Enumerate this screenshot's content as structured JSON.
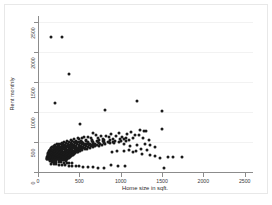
{
  "chart_data": {
    "type": "scatter",
    "title": "",
    "xlabel": "Home size in sqft.",
    "ylabel": "Rent monthly",
    "xlim": [
      0,
      2600
    ],
    "ylim": [
      0,
      2600
    ],
    "xticks": [
      0,
      500,
      1000,
      1500,
      2000,
      2500
    ],
    "yticks": [
      0,
      500,
      1000,
      1500,
      2000,
      2500
    ],
    "xticklabels": [
      "0",
      "500",
      "1000",
      "1500",
      "2000",
      "2500"
    ],
    "yticklabels": [
      "0",
      "500",
      "1000",
      "1500",
      "2000",
      "2500"
    ],
    "grid": "horizontal",
    "legend": "none",
    "marker": {
      "shape": "circle",
      "color": "#1a1a1a",
      "size": 3
    },
    "background_color": "#ffffff",
    "frame_color": "#e8e8e8",
    "axis_color": "#8c8c8c",
    "gridline_color": "#f2f2f2",
    "n_points": 330,
    "points": [
      [
        160,
        2250
      ],
      [
        290,
        2250
      ],
      [
        370,
        1640
      ],
      [
        205,
        1145
      ],
      [
        1200,
        1185
      ],
      [
        815,
        1040
      ],
      [
        1495,
        1010
      ],
      [
        505,
        805
      ],
      [
        1500,
        720
      ],
      [
        1230,
        700
      ],
      [
        1305,
        690
      ],
      [
        1285,
        680
      ],
      [
        1120,
        660
      ],
      [
        975,
        650
      ],
      [
        1080,
        640
      ],
      [
        660,
        645
      ],
      [
        700,
        620
      ],
      [
        885,
        635
      ],
      [
        1175,
        620
      ],
      [
        1225,
        615
      ],
      [
        760,
        600
      ],
      [
        820,
        600
      ],
      [
        945,
        595
      ],
      [
        1015,
        590
      ],
      [
        560,
        590
      ],
      [
        610,
        585
      ],
      [
        860,
        580
      ],
      [
        1060,
        575
      ],
      [
        1145,
        570
      ],
      [
        1265,
        565
      ],
      [
        480,
        575
      ],
      [
        530,
        565
      ],
      [
        640,
        560
      ],
      [
        720,
        560
      ],
      [
        790,
        555
      ],
      [
        905,
        550
      ],
      [
        995,
        550
      ],
      [
        1040,
        545
      ],
      [
        1100,
        540
      ],
      [
        1340,
        540
      ],
      [
        430,
        550
      ],
      [
        500,
        545
      ],
      [
        575,
        540
      ],
      [
        655,
        535
      ],
      [
        735,
        535
      ],
      [
        800,
        530
      ],
      [
        870,
        528
      ],
      [
        930,
        525
      ],
      [
        1000,
        520
      ],
      [
        1070,
        518
      ],
      [
        395,
        530
      ],
      [
        455,
        525
      ],
      [
        520,
        520
      ],
      [
        585,
        518
      ],
      [
        650,
        515
      ],
      [
        715,
        512
      ],
      [
        780,
        510
      ],
      [
        845,
        508
      ],
      [
        910,
        505
      ],
      [
        975,
        502
      ],
      [
        350,
        515
      ],
      [
        410,
        512
      ],
      [
        470,
        508
      ],
      [
        535,
        505
      ],
      [
        600,
        502
      ],
      [
        665,
        500
      ],
      [
        730,
        498
      ],
      [
        795,
        495
      ],
      [
        860,
        492
      ],
      [
        925,
        490
      ],
      [
        320,
        500
      ],
      [
        375,
        498
      ],
      [
        430,
        495
      ],
      [
        490,
        492
      ],
      [
        550,
        490
      ],
      [
        610,
        488
      ],
      [
        670,
        485
      ],
      [
        735,
        482
      ],
      [
        800,
        480
      ],
      [
        865,
        478
      ],
      [
        285,
        488
      ],
      [
        340,
        485
      ],
      [
        395,
        482
      ],
      [
        450,
        480
      ],
      [
        510,
        478
      ],
      [
        570,
        475
      ],
      [
        630,
        472
      ],
      [
        690,
        470
      ],
      [
        750,
        468
      ],
      [
        815,
        465
      ],
      [
        255,
        475
      ],
      [
        305,
        472
      ],
      [
        360,
        470
      ],
      [
        415,
        468
      ],
      [
        470,
        465
      ],
      [
        530,
        462
      ],
      [
        590,
        460
      ],
      [
        650,
        458
      ],
      [
        710,
        455
      ],
      [
        770,
        452
      ],
      [
        230,
        462
      ],
      [
        280,
        460
      ],
      [
        330,
        458
      ],
      [
        385,
        455
      ],
      [
        440,
        452
      ],
      [
        495,
        450
      ],
      [
        555,
        448
      ],
      [
        615,
        445
      ],
      [
        675,
        442
      ],
      [
        735,
        440
      ],
      [
        210,
        450
      ],
      [
        258,
        448
      ],
      [
        308,
        445
      ],
      [
        358,
        442
      ],
      [
        410,
        440
      ],
      [
        465,
        438
      ],
      [
        520,
        435
      ],
      [
        578,
        432
      ],
      [
        635,
        430
      ],
      [
        695,
        428
      ],
      [
        195,
        438
      ],
      [
        240,
        435
      ],
      [
        288,
        432
      ],
      [
        336,
        430
      ],
      [
        386,
        428
      ],
      [
        438,
        425
      ],
      [
        492,
        422
      ],
      [
        546,
        420
      ],
      [
        602,
        418
      ],
      [
        660,
        415
      ],
      [
        182,
        425
      ],
      [
        225,
        422
      ],
      [
        270,
        420
      ],
      [
        316,
        418
      ],
      [
        364,
        415
      ],
      [
        413,
        412
      ],
      [
        464,
        410
      ],
      [
        516,
        408
      ],
      [
        570,
        405
      ],
      [
        625,
        402
      ],
      [
        172,
        412
      ],
      [
        212,
        410
      ],
      [
        255,
        408
      ],
      [
        299,
        405
      ],
      [
        344,
        402
      ],
      [
        391,
        400
      ],
      [
        439,
        398
      ],
      [
        489,
        395
      ],
      [
        540,
        392
      ],
      [
        592,
        390
      ],
      [
        162,
        400
      ],
      [
        200,
        398
      ],
      [
        241,
        395
      ],
      [
        283,
        392
      ],
      [
        326,
        390
      ],
      [
        371,
        388
      ],
      [
        417,
        385
      ],
      [
        464,
        382
      ],
      [
        513,
        380
      ],
      [
        563,
        378
      ],
      [
        154,
        388
      ],
      [
        190,
        385
      ],
      [
        229,
        382
      ],
      [
        269,
        380
      ],
      [
        310,
        378
      ],
      [
        353,
        375
      ],
      [
        397,
        372
      ],
      [
        442,
        370
      ],
      [
        489,
        368
      ],
      [
        537,
        365
      ],
      [
        147,
        375
      ],
      [
        181,
        372
      ],
      [
        218,
        370
      ],
      [
        256,
        368
      ],
      [
        295,
        365
      ],
      [
        336,
        362
      ],
      [
        378,
        360
      ],
      [
        421,
        358
      ],
      [
        466,
        355
      ],
      [
        512,
        352
      ],
      [
        141,
        362
      ],
      [
        173,
        360
      ],
      [
        208,
        358
      ],
      [
        244,
        355
      ],
      [
        282,
        352
      ],
      [
        321,
        350
      ],
      [
        361,
        348
      ],
      [
        402,
        345
      ],
      [
        445,
        342
      ],
      [
        489,
        340
      ],
      [
        136,
        350
      ],
      [
        167,
        348
      ],
      [
        200,
        345
      ],
      [
        234,
        342
      ],
      [
        270,
        340
      ],
      [
        307,
        338
      ],
      [
        345,
        335
      ],
      [
        385,
        332
      ],
      [
        426,
        330
      ],
      [
        468,
        328
      ],
      [
        132,
        338
      ],
      [
        161,
        335
      ],
      [
        193,
        332
      ],
      [
        226,
        330
      ],
      [
        260,
        328
      ],
      [
        296,
        325
      ],
      [
        333,
        322
      ],
      [
        371,
        320
      ],
      [
        410,
        318
      ],
      [
        451,
        315
      ],
      [
        128,
        325
      ],
      [
        156,
        322
      ],
      [
        187,
        320
      ],
      [
        218,
        318
      ],
      [
        251,
        315
      ],
      [
        285,
        312
      ],
      [
        320,
        310
      ],
      [
        357,
        308
      ],
      [
        394,
        305
      ],
      [
        433,
        302
      ],
      [
        125,
        312
      ],
      [
        152,
        310
      ],
      [
        181,
        308
      ],
      [
        211,
        305
      ],
      [
        243,
        302
      ],
      [
        276,
        300
      ],
      [
        310,
        298
      ],
      [
        345,
        295
      ],
      [
        381,
        292
      ],
      [
        419,
        290
      ],
      [
        122,
        300
      ],
      [
        148,
        298
      ],
      [
        176,
        295
      ],
      [
        205,
        292
      ],
      [
        236,
        290
      ],
      [
        268,
        288
      ],
      [
        301,
        285
      ],
      [
        335,
        282
      ],
      [
        370,
        280
      ],
      [
        406,
        278
      ],
      [
        119,
        288
      ],
      [
        144,
        285
      ],
      [
        171,
        282
      ],
      [
        199,
        280
      ],
      [
        229,
        278
      ],
      [
        260,
        275
      ],
      [
        292,
        272
      ],
      [
        325,
        270
      ],
      [
        359,
        268
      ],
      [
        394,
        265
      ],
      [
        117,
        275
      ],
      [
        141,
        272
      ],
      [
        167,
        270
      ],
      [
        194,
        268
      ],
      [
        223,
        265
      ],
      [
        253,
        262
      ],
      [
        284,
        260
      ],
      [
        316,
        258
      ],
      [
        349,
        255
      ],
      [
        383,
        252
      ],
      [
        115,
        262
      ],
      [
        138,
        260
      ],
      [
        163,
        258
      ],
      [
        189,
        255
      ],
      [
        217,
        252
      ],
      [
        246,
        250
      ],
      [
        276,
        248
      ],
      [
        307,
        245
      ],
      [
        339,
        242
      ],
      [
        372,
        240
      ],
      [
        113,
        250
      ],
      [
        135,
        248
      ],
      [
        159,
        245
      ],
      [
        185,
        242
      ],
      [
        212,
        240
      ],
      [
        240,
        238
      ],
      [
        269,
        235
      ],
      [
        299,
        232
      ],
      [
        330,
        230
      ],
      [
        362,
        228
      ],
      [
        112,
        238
      ],
      [
        133,
        235
      ],
      [
        156,
        232
      ],
      [
        181,
        230
      ],
      [
        207,
        228
      ],
      [
        234,
        225
      ],
      [
        262,
        222
      ],
      [
        291,
        220
      ],
      [
        321,
        218
      ],
      [
        352,
        215
      ],
      [
        111,
        225
      ],
      [
        131,
        222
      ],
      [
        153,
        220
      ],
      [
        177,
        218
      ],
      [
        202,
        215
      ],
      [
        228,
        212
      ],
      [
        255,
        210
      ],
      [
        283,
        208
      ],
      [
        312,
        205
      ],
      [
        342,
        202
      ],
      [
        110,
        212
      ],
      [
        130,
        210
      ],
      [
        151,
        208
      ],
      [
        174,
        205
      ],
      [
        198,
        202
      ],
      [
        223,
        200
      ],
      [
        249,
        198
      ],
      [
        276,
        195
      ],
      [
        304,
        192
      ],
      [
        333,
        190
      ],
      [
        140,
        180
      ],
      [
        165,
        175
      ],
      [
        192,
        172
      ],
      [
        220,
        168
      ],
      [
        250,
        165
      ],
      [
        281,
        162
      ],
      [
        313,
        158
      ],
      [
        346,
        155
      ],
      [
        380,
        150
      ],
      [
        415,
        148
      ],
      [
        160,
        140
      ],
      [
        190,
        135
      ],
      [
        222,
        130
      ],
      [
        256,
        125
      ],
      [
        292,
        120
      ],
      [
        330,
        115
      ],
      [
        370,
        108
      ],
      [
        412,
        102
      ],
      [
        455,
        98
      ],
      [
        500,
        92
      ],
      [
        545,
        88
      ],
      [
        600,
        82
      ],
      [
        660,
        78
      ],
      [
        725,
        72
      ],
      [
        800,
        68
      ],
      [
        880,
        118
      ],
      [
        965,
        108
      ],
      [
        1055,
        92
      ],
      [
        1150,
        330
      ],
      [
        1255,
        300
      ],
      [
        1350,
        280
      ],
      [
        1420,
        260
      ],
      [
        1475,
        240
      ],
      [
        1520,
        60
      ],
      [
        1570,
        245
      ],
      [
        1630,
        250
      ],
      [
        1740,
        255
      ],
      [
        1415,
        425
      ],
      [
        1355,
        450
      ],
      [
        1290,
        470
      ],
      [
        1195,
        445
      ],
      [
        1110,
        430
      ],
      [
        1040,
        470
      ],
      [
        1320,
        360
      ],
      [
        1240,
        380
      ],
      [
        1180,
        355
      ],
      [
        1105,
        365
      ],
      [
        1035,
        345
      ],
      [
        960,
        350
      ],
      [
        890,
        340
      ]
    ]
  }
}
